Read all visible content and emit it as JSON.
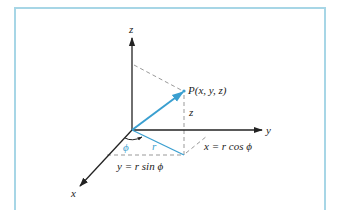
{
  "diagram": {
    "colors": {
      "frame": "#a7d6e6",
      "accent": "#3a9fd0",
      "axis": "#222222",
      "dash": "#999999"
    },
    "axes": {
      "x_label": "x",
      "y_label": "y",
      "z_label": "z"
    },
    "point_label": "P(x, y, z)",
    "height_label": "z",
    "angle_label": "ϕ",
    "radius_label": "r",
    "x_equation": "x = r cos ϕ",
    "y_equation": "y = r sin ϕ"
  }
}
